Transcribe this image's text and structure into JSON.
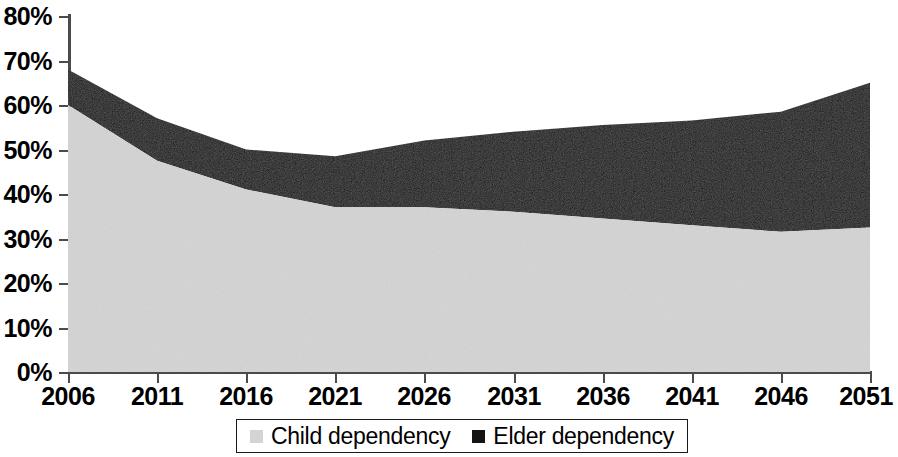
{
  "chart_data": {
    "type": "area",
    "stacked": true,
    "title": "",
    "subtitle": "",
    "xlabel": "",
    "ylabel": "",
    "categories": [
      "2006",
      "2011",
      "2016",
      "2021",
      "2026",
      "2031",
      "2036",
      "2041",
      "2046",
      "2051"
    ],
    "x": [
      2006,
      2011,
      2016,
      2021,
      2026,
      2031,
      2036,
      2041,
      2046,
      2051
    ],
    "series": [
      {
        "name": "Child dependency",
        "color": "#d4d4d4",
        "values": [
          60,
          47.5,
          41,
          37,
          37,
          36,
          34.5,
          33,
          31.5,
          32.5
        ]
      },
      {
        "name": "Elder dependency",
        "color": "#141414",
        "values": [
          8,
          9.5,
          9,
          11.5,
          15,
          18,
          21,
          23.5,
          27,
          32.5
        ]
      }
    ],
    "totals": [
      68,
      57,
      50,
      48.5,
      52,
      54,
      55.5,
      56.5,
      58.5,
      65
    ],
    "ylim": [
      0,
      80
    ],
    "ytick_values": [
      0,
      10,
      20,
      30,
      40,
      50,
      60,
      70,
      80
    ],
    "ytick_labels": [
      "0%",
      "10%",
      "20%",
      "30%",
      "40%",
      "50%",
      "60%",
      "70%",
      "80%"
    ],
    "xlim": [
      2006,
      2051
    ],
    "xtick_labels": [
      "2006",
      "2011",
      "2016",
      "2021",
      "2026",
      "2031",
      "2036",
      "2041",
      "2046",
      "2051"
    ],
    "grid": false,
    "legend_position": "bottom",
    "legend_entries": [
      {
        "label": "Child dependency",
        "swatch": "#d4d4d4"
      },
      {
        "label": "Elder dependency",
        "swatch": "#141414"
      }
    ]
  },
  "axis": {
    "y_labels": [
      "80%",
      "70%",
      "60%",
      "50%",
      "40%",
      "30%",
      "20%",
      "10%",
      "0%"
    ],
    "x_labels": [
      "2006",
      "2011",
      "2016",
      "2021",
      "2026",
      "2031",
      "2036",
      "2041",
      "2046",
      "2051"
    ]
  },
  "legend": {
    "items": [
      {
        "label": "Child dependency"
      },
      {
        "label": "Elder dependency"
      }
    ]
  },
  "colors": {
    "child_area": "#d4d4d4",
    "elder_area": "#141414",
    "axis": "#4b4b4b",
    "text": "#000000",
    "background": "#ffffff"
  }
}
